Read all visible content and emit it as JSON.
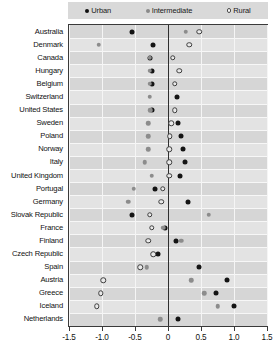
{
  "legend": {
    "position": "top",
    "items": [
      {
        "label": "Urban",
        "key": "urban",
        "marker": "filled-circle-black",
        "color": "#111111"
      },
      {
        "label": "Intermediate",
        "key": "intermediate",
        "marker": "filled-circle-gray",
        "color": "#8a8a8a"
      },
      {
        "label": "Rural",
        "key": "rural",
        "marker": "open-circle",
        "color": "#ffffff"
      }
    ]
  },
  "chart_data": {
    "type": "scatter",
    "title": "",
    "subtitle": "",
    "xlabel": "",
    "ylabel": "",
    "orientation": "horizontal",
    "xlim": [
      -1.5,
      1.5
    ],
    "xticks": [
      -1.5,
      -1.0,
      -0.5,
      0,
      0.5,
      1.0,
      1.5
    ],
    "xticklabels": [
      "-1.5",
      "-1.0",
      "-0.5",
      "0",
      "0.5",
      "1.0",
      "1.5"
    ],
    "grid": "vertical-gridlines-at-ticks",
    "zero_reference_line": 0,
    "legend_position": "top",
    "categories": [
      "Australia",
      "Denmark",
      "Canada",
      "Hungary",
      "Belgium",
      "Switzerland",
      "United States",
      "Sweden",
      "Poland",
      "Norway",
      "Italy",
      "United Kingdom",
      "Portugal",
      "Germany",
      "Slovak Republic",
      "France",
      "Finland",
      "Czech Republic",
      "Spain",
      "Austria",
      "Greece",
      "Iceland",
      "Netherlands"
    ],
    "series": [
      {
        "name": "Urban",
        "key": "urban",
        "color": "#111111",
        "marker": "filled-circle-black",
        "values": [
          -0.55,
          -0.22,
          -0.28,
          -0.25,
          -0.25,
          0.13,
          -0.25,
          0.15,
          0.2,
          0.22,
          0.25,
          0.18,
          -0.2,
          0.3,
          -0.55,
          -0.04,
          0.12,
          -0.15,
          0.47,
          0.9,
          0.72,
          1.0,
          0.15
        ]
      },
      {
        "name": "Intermediate",
        "key": "intermediate",
        "color": "#8a8a8a",
        "marker": "filled-circle-gray",
        "values": [
          0.27,
          -1.05,
          -0.28,
          -0.28,
          -0.28,
          -0.28,
          -0.27,
          -0.3,
          -0.3,
          -0.3,
          -0.35,
          -0.25,
          -0.52,
          -0.6,
          0.62,
          -0.07,
          0.2,
          -0.22,
          -0.32,
          0.35,
          0.55,
          0.75,
          -0.12
        ]
      },
      {
        "name": "Rural",
        "key": "rural",
        "color": "#ffffff",
        "marker": "open-circle",
        "values": [
          0.47,
          0.32,
          0.07,
          0.17,
          0.1,
          null,
          0.1,
          0.05,
          0.03,
          0.02,
          0.02,
          0.02,
          -0.08,
          -0.1,
          -0.28,
          -0.25,
          -0.3,
          -0.22,
          -0.42,
          -0.98,
          -1.02,
          -1.08,
          null
        ]
      }
    ]
  }
}
